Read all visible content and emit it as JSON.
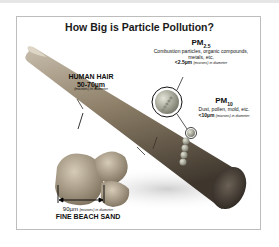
{
  "title": "How Big is Particle Pollution?",
  "hair": {
    "name": "HUMAN HAIR",
    "size": "50-70µm",
    "unit_note": "(microns) in diameter"
  },
  "pm25": {
    "label": "PM",
    "subscript": "2.5",
    "description": "Combustion particles, organic compounds, metals, etc.",
    "size": "<2.5µm",
    "unit_note": "(microns) in diameter"
  },
  "pm10": {
    "label": "PM",
    "subscript": "10",
    "description": "Dust, pollen, mold, etc.",
    "size": "<10µm",
    "unit_note": "(microns) in diameter"
  },
  "sand": {
    "size": "90µm",
    "unit_note": "(microns) in diameter",
    "name": "FINE BEACH SAND"
  },
  "colors": {
    "hair": "#8a7a62",
    "hair_dark": "#4a4035",
    "sand": "#b5a58c",
    "particle": "#9a9a8a"
  }
}
